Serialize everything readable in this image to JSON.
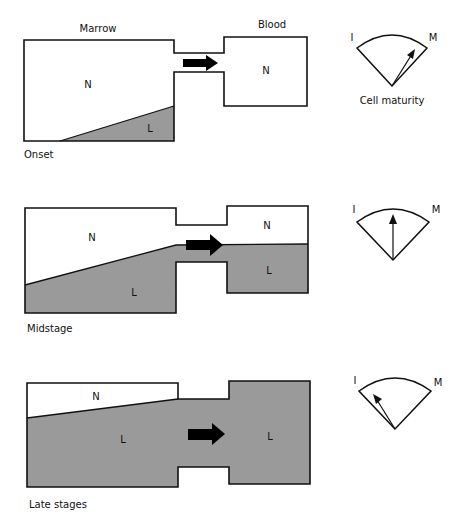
{
  "colors": {
    "leukemic_fill": "#9a9a9a",
    "normal_fill": "#ffffff",
    "outline": "#111111",
    "arrow": "#000000"
  },
  "headers": {
    "marrow": "Marrow",
    "blood": "Blood"
  },
  "gauge_caption": "Cell maturity",
  "panels": [
    {
      "stage_label": "Onset",
      "marrow_region_labels": [
        "N",
        "L"
      ],
      "blood_region_labels": [
        "N"
      ],
      "gauge": {
        "left_label": "I",
        "right_label": "M",
        "pointer": "mostly mature (toward M)"
      }
    },
    {
      "stage_label": "Midstage",
      "marrow_region_labels": [
        "N",
        "L"
      ],
      "blood_region_labels": [
        "N",
        "L"
      ],
      "gauge": {
        "left_label": "I",
        "right_label": "M",
        "pointer": "center"
      }
    },
    {
      "stage_label": "Late stages",
      "marrow_region_labels": [
        "N",
        "L"
      ],
      "blood_region_labels": [
        "L"
      ],
      "gauge": {
        "left_label": "I",
        "right_label": "M",
        "pointer": "immature (toward I)"
      }
    }
  ]
}
